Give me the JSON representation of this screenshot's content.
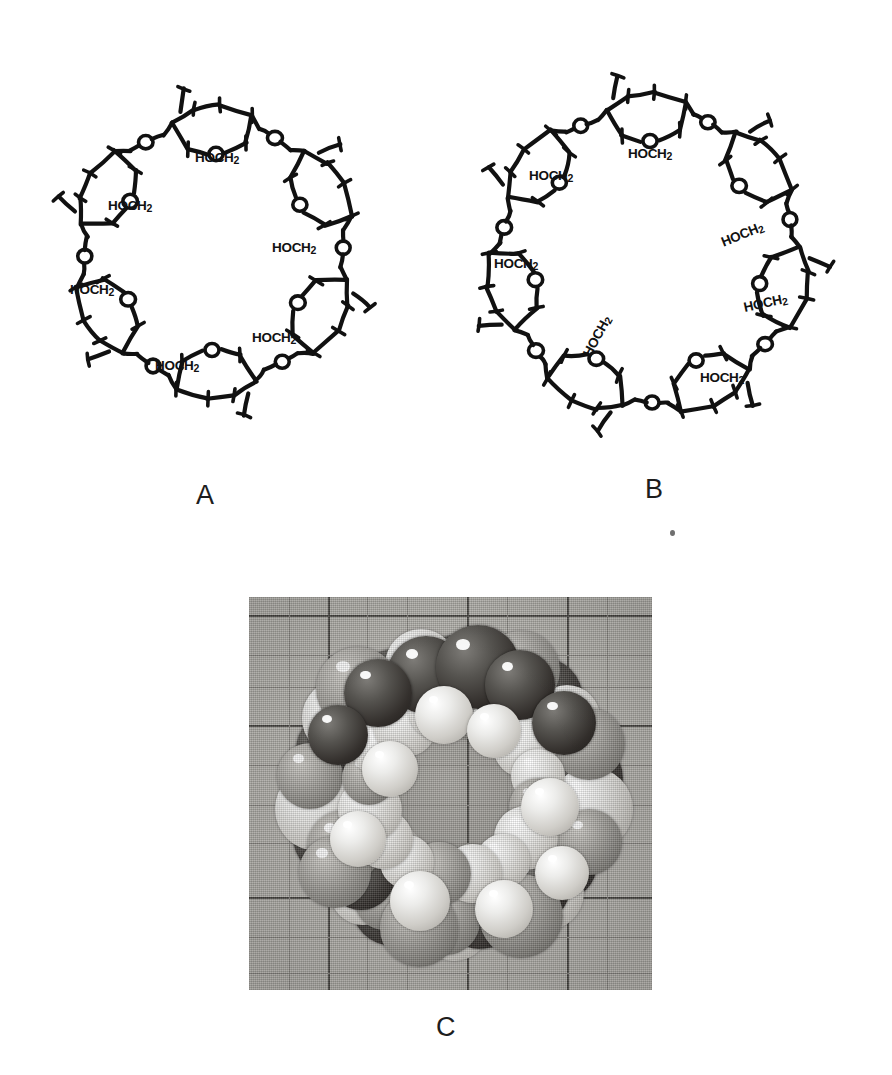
{
  "figure": {
    "background_color": "#ffffff",
    "panels": [
      {
        "id": "A",
        "label": "A",
        "kind": "chemical-structure",
        "molecule": "alpha-cyclodextrin",
        "glucose_units": 6,
        "substituent_label": "HOCH2",
        "substituent_label_html": "HOCH₂",
        "ring_oxygen_label": "O",
        "glycosidic_oxygen_label": "O",
        "substituent_count": 6,
        "line_color": "#111111"
      },
      {
        "id": "B",
        "label": "B",
        "kind": "chemical-structure",
        "molecule": "beta-cyclodextrin",
        "glucose_units": 7,
        "substituent_label": "HOCH2",
        "substituent_label_html": "HOCH₂",
        "ring_oxygen_label": "O",
        "glycosidic_oxygen_label": "O",
        "substituent_count": 7,
        "line_color": "#111111"
      },
      {
        "id": "C",
        "label": "C",
        "kind": "photograph",
        "subject": "space-filling molecular model of cyclodextrin on graph paper",
        "background_color": "#b4b2ad",
        "grid_line_color": "#4a4844",
        "atom_colors": {
          "dark": "#332f2c",
          "light": "#ececea",
          "mid": "#adaba6"
        }
      }
    ],
    "artifact": {
      "name": "printing-speck",
      "color": "#6f6f6f"
    }
  },
  "structure_a": {
    "label": "A",
    "hoch2_labels": [
      {
        "text": "HOCH",
        "sub": "2",
        "x": 195,
        "y": 150,
        "rot": 0
      },
      {
        "text": "HOCH",
        "sub": "2",
        "x": 108,
        "y": 198,
        "rot": 0
      },
      {
        "text": "HOCH",
        "sub": "2",
        "x": 70,
        "y": 282,
        "rot": 0
      },
      {
        "text": "HOCH",
        "sub": "2",
        "x": 155,
        "y": 358,
        "rot": 0
      },
      {
        "text": "HOCH",
        "sub": "2",
        "x": 252,
        "y": 330,
        "rot": 0
      },
      {
        "text": "HOCH",
        "sub": "2",
        "x": 272,
        "y": 240,
        "rot": 0
      }
    ]
  },
  "structure_b": {
    "label": "B",
    "hoch2_labels": [
      {
        "text": "HOCH",
        "sub": "2",
        "x": 628,
        "y": 146,
        "rot": 0
      },
      {
        "text": "HOCH",
        "sub": "2",
        "x": 529,
        "y": 168,
        "rot": 0
      },
      {
        "text": "HOCH",
        "sub": "2",
        "x": 494,
        "y": 256,
        "rot": 0
      },
      {
        "text": "HOCH",
        "sub": "2",
        "x": 587,
        "y": 348,
        "rot": -62
      },
      {
        "text": "HOCH",
        "sub": "2",
        "x": 700,
        "y": 370,
        "rot": 0
      },
      {
        "text": "HOCH",
        "sub": "2",
        "x": 744,
        "y": 300,
        "rot": -12
      },
      {
        "text": "HOCH",
        "sub": "2",
        "x": 722,
        "y": 235,
        "rot": -22
      }
    ]
  },
  "chart_data": {
    "type": "table",
    "columns": [
      "panel",
      "content",
      "glucose units"
    ],
    "rows": [
      [
        "A",
        "alpha-cyclodextrin line structure",
        6
      ],
      [
        "B",
        "beta-cyclodextrin line structure",
        7
      ],
      [
        "C",
        "space-filling model photograph",
        6
      ]
    ]
  }
}
